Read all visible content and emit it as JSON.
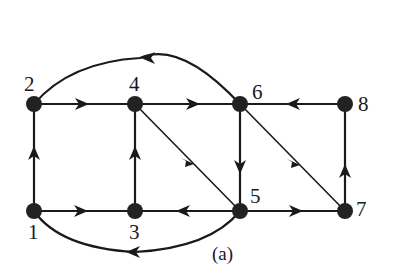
{
  "figure": {
    "caption": "(a)",
    "type": "directed-graph"
  },
  "nodes": [
    {
      "id": "1",
      "label": "1",
      "x": 34,
      "y": 211
    },
    {
      "id": "2",
      "label": "2",
      "x": 34,
      "y": 104
    },
    {
      "id": "3",
      "label": "3",
      "x": 135,
      "y": 211
    },
    {
      "id": "4",
      "label": "4",
      "x": 135,
      "y": 104
    },
    {
      "id": "5",
      "label": "5",
      "x": 240,
      "y": 211
    },
    {
      "id": "6",
      "label": "6",
      "x": 240,
      "y": 104
    },
    {
      "id": "7",
      "label": "7",
      "x": 345,
      "y": 211
    },
    {
      "id": "8",
      "label": "8",
      "x": 345,
      "y": 104
    }
  ],
  "edges": [
    {
      "from": "1",
      "to": "2",
      "shape": "straight"
    },
    {
      "from": "1",
      "to": "3",
      "shape": "straight"
    },
    {
      "from": "2",
      "to": "4",
      "shape": "straight"
    },
    {
      "from": "3",
      "to": "4",
      "shape": "straight"
    },
    {
      "from": "5",
      "to": "3",
      "shape": "straight"
    },
    {
      "from": "4",
      "to": "6",
      "shape": "straight"
    },
    {
      "from": "4",
      "to": "5",
      "shape": "diagonal"
    },
    {
      "from": "6",
      "to": "5",
      "shape": "straight"
    },
    {
      "from": "8",
      "to": "6",
      "shape": "straight"
    },
    {
      "from": "6",
      "to": "7",
      "shape": "diagonal"
    },
    {
      "from": "5",
      "to": "7",
      "shape": "straight"
    },
    {
      "from": "7",
      "to": "8",
      "shape": "straight"
    },
    {
      "from": "6",
      "to": "2",
      "shape": "arc-over"
    },
    {
      "from": "5",
      "to": "1",
      "shape": "arc-under"
    }
  ]
}
